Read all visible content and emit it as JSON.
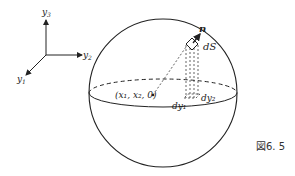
{
  "figure": {
    "caption": "図6. 5",
    "axes": {
      "y1": "y",
      "y1_sub": "1",
      "y2": "y",
      "y2_sub": "2",
      "y3": "y",
      "y3_sub": "3"
    },
    "labels": {
      "normal": "n",
      "surface_element": "dS",
      "point": "(x₁, x₂, 0)",
      "dy1": "dy₁",
      "dy2": "dy₂"
    }
  }
}
